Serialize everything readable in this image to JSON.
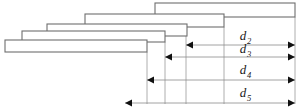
{
  "figure": {
    "background_color": "#ffffff",
    "bar_stroke_color": "#6e6e6e",
    "bar_fill_color": "#ffffff",
    "dimension_line_color": "#8a8a8a",
    "arrow_color": "#111111",
    "label_color": "#1a1a1a",
    "width": 302,
    "height": 112
  },
  "bars": [
    {
      "id": "bar-1",
      "x": 155,
      "y": 3,
      "width": 140,
      "height": 14
    },
    {
      "id": "bar-2",
      "x": 85,
      "y": 14,
      "width": 139,
      "height": 13
    },
    {
      "id": "bar-3",
      "x": 47,
      "y": 24,
      "width": 140,
      "height": 12
    },
    {
      "id": "bar-4",
      "x": 22,
      "y": 31,
      "width": 143,
      "height": 11
    },
    {
      "id": "bar-5",
      "x": 5,
      "y": 40,
      "width": 142,
      "height": 12
    }
  ],
  "drop_lines": [
    {
      "id": "drop-right-edge",
      "x": 295,
      "y1": 17,
      "y2": 104
    },
    {
      "id": "drop-bar2-end",
      "x": 224,
      "y1": 27,
      "y2": 104
    },
    {
      "id": "drop-bar3-end",
      "x": 186,
      "y1": 36,
      "y2": 104
    },
    {
      "id": "drop-bar4-end",
      "x": 165,
      "y1": 42,
      "y2": 104
    },
    {
      "id": "drop-bar5-end",
      "x": 147,
      "y1": 52,
      "y2": 104
    }
  ],
  "dimensions": [
    {
      "id": "dimension-d2",
      "label": "d",
      "subscript": "2",
      "y": 45,
      "x_start": 186,
      "x_end": 295,
      "label_x": 243,
      "label_y": 40
    },
    {
      "id": "dimension-d3",
      "label": "d",
      "subscript": "3",
      "y": 57,
      "x_start": 165,
      "x_end": 295,
      "label_x": 243,
      "label_y": 53
    },
    {
      "id": "dimension-d4",
      "label": "d",
      "subscript": "4",
      "y": 80,
      "x_start": 147,
      "x_end": 295,
      "label_x": 243,
      "label_y": 74
    },
    {
      "id": "dimension-d5",
      "label": "d",
      "subscript": "5",
      "y": 103,
      "x_start": 125,
      "x_end": 295,
      "label_x": 243,
      "label_y": 97
    }
  ]
}
